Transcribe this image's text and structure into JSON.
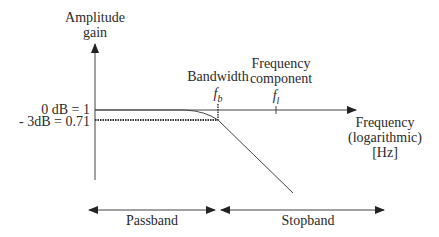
{
  "diagram": {
    "type": "low-pass filter frequency response",
    "y_axis": {
      "label_line1": "Amplitude",
      "label_line2": "gain"
    },
    "x_axis": {
      "label_line1": "Frequency",
      "label_line2": "(logarithmic)",
      "label_line3": "[Hz]"
    },
    "levels": {
      "zero_db": "0 dB = 1",
      "minus_3db": "- 3dB = 0.71"
    },
    "markers": {
      "bandwidth_label": "Bandwidth",
      "bandwidth_symbol": "f",
      "bandwidth_subscript": "b",
      "component_label_line1": "Frequency",
      "component_label_line2": "component",
      "component_symbol": "f",
      "component_subscript": "l"
    },
    "bands": {
      "passband": "Passband",
      "stopband": "Stopband"
    },
    "colors": {
      "line": "#333333",
      "text": "#2a2a2a",
      "background": "#ffffff"
    }
  }
}
